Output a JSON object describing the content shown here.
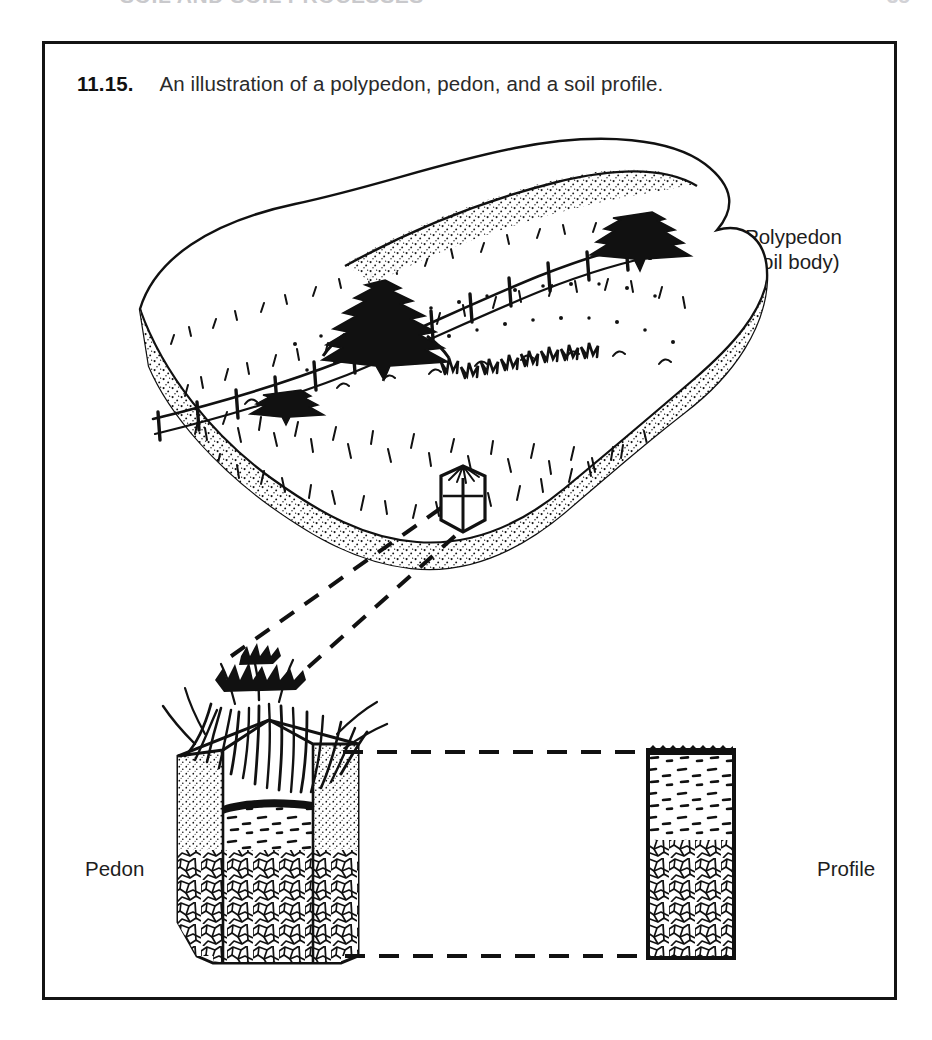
{
  "page": {
    "running_head": "SOIL AND SOIL PROCESSES",
    "folio": "35"
  },
  "figure": {
    "caption_number": "11.15.",
    "caption_text": "An illustration of a polypedon, pedon, and a soil profile.",
    "labels": {
      "polypedon_line1": "Polypedon",
      "polypedon_line2": "(soil body)",
      "pedon": "Pedon",
      "profile": "Profile"
    }
  },
  "colors": {
    "ink": "#111111",
    "frame": "#141414",
    "paper": "#ffffff",
    "caption_text": "#2a2a2a"
  },
  "diagram": {
    "type": "line-illustration",
    "parts": [
      {
        "name": "polypedon-block",
        "description": "Pen-and-ink oblique block diagram of a grass-covered hill with scattered conifer trees and a post-and-rail fence running over the crest; the block is cut away to show a stippled topsoil band over a blocky weathered-rock band."
      },
      {
        "name": "pedon-marker",
        "description": "Small hexagonal column outlined on the near edge of the polypedon block marking the single pedon sampled."
      },
      {
        "name": "pedon-column",
        "description": "Enlarged hexagonal soil column with grass tuft on top, stippled A/B horizon material, and blocky C horizon rock fragments below."
      },
      {
        "name": "profile-panel",
        "description": "Flat two-dimensional rectangular soil profile: dashed-textured upper horizon over blocky rock-fragment lower horizon."
      },
      {
        "name": "leader-lines",
        "description": "Dashed leader lines linking the pedon marker on the block to the enlarged pedon, and horizontal dashed lines linking the pedon top and base to the profile panel."
      }
    ]
  }
}
